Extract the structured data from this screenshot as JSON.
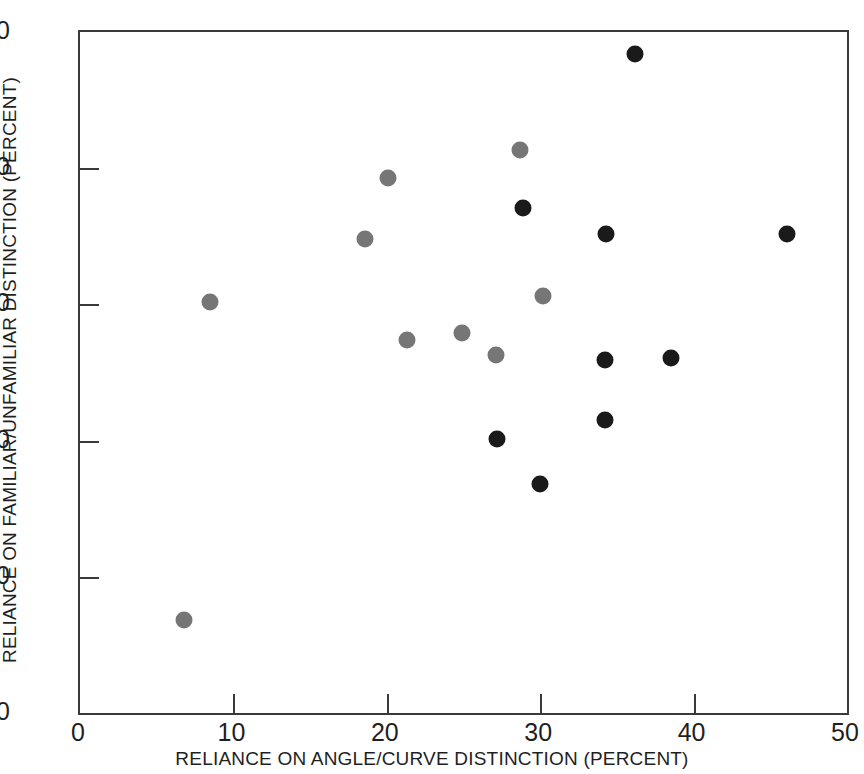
{
  "chart_data": {
    "type": "scatter",
    "title": "",
    "xlabel": "RELIANCE ON ANGLE/CURVE DISTINCTION (PERCENT)",
    "ylabel": "RELIANCE ON FAMILIAR/UNFAMILIAR DISTINCTION (PERCENT)",
    "xlim": [
      0,
      50
    ],
    "ylim": [
      0,
      50
    ],
    "xticks": [
      0,
      10,
      20,
      30,
      40,
      50
    ],
    "yticks": [
      0,
      10,
      20,
      30,
      40,
      50
    ],
    "xticklabels": [
      "0",
      "10",
      "20",
      "30",
      "40",
      "50"
    ],
    "yticklabels": [
      "0",
      "10",
      "20",
      "30",
      "40",
      "50"
    ],
    "grid": false,
    "legend": null,
    "marker_size_px": 17,
    "series": [
      {
        "name": "gray-group",
        "color": "#767676",
        "points": [
          {
            "x": 6.8,
            "y": 6.8
          },
          {
            "x": 8.5,
            "y": 30.2
          },
          {
            "x": 18.6,
            "y": 34.8
          },
          {
            "x": 20.1,
            "y": 39.3
          },
          {
            "x": 21.3,
            "y": 27.4
          },
          {
            "x": 24.9,
            "y": 27.9
          },
          {
            "x": 27.1,
            "y": 26.3
          },
          {
            "x": 28.7,
            "y": 41.3
          },
          {
            "x": 30.2,
            "y": 30.6
          }
        ]
      },
      {
        "name": "black-group",
        "color": "#1a1a1a",
        "points": [
          {
            "x": 27.2,
            "y": 20.1
          },
          {
            "x": 28.9,
            "y": 37.1
          },
          {
            "x": 30.0,
            "y": 16.8
          },
          {
            "x": 34.2,
            "y": 25.9
          },
          {
            "x": 34.2,
            "y": 21.5
          },
          {
            "x": 34.3,
            "y": 35.2
          },
          {
            "x": 36.2,
            "y": 48.4
          },
          {
            "x": 38.5,
            "y": 26.1
          },
          {
            "x": 46.1,
            "y": 35.2
          }
        ]
      }
    ]
  },
  "axes": {
    "frame_color": "#3a3a3a",
    "background": "#ffffff"
  }
}
